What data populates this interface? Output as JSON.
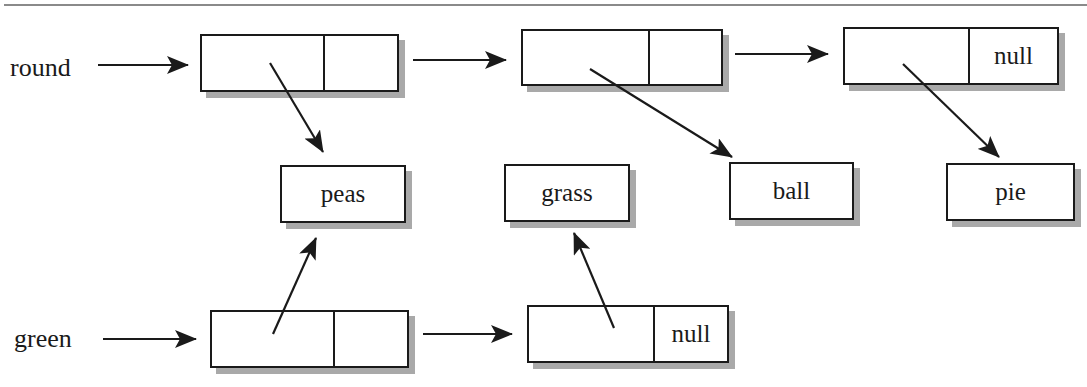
{
  "diagram": {
    "type": "linked-list",
    "lists": [
      {
        "name": "round",
        "nodes": [
          {
            "data_ref": "peas",
            "next": ""
          },
          {
            "data_ref": "ball",
            "next": ""
          },
          {
            "data_ref": "pie",
            "next": "null"
          }
        ]
      },
      {
        "name": "green",
        "nodes": [
          {
            "data_ref": "peas",
            "next": ""
          },
          {
            "data_ref": "grass",
            "next": "null"
          }
        ]
      }
    ],
    "values": [
      "peas",
      "grass",
      "ball",
      "pie"
    ]
  },
  "colors": {
    "line": "#1a1a1a",
    "shadow": "#a9a9a9",
    "rule": "#8a8a8a"
  }
}
